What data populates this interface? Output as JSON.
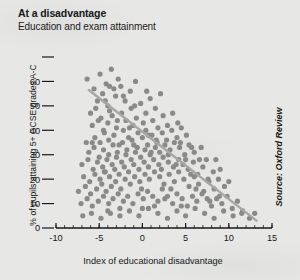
{
  "figure": {
    "title": "At a disadvantage",
    "subtitle": "Education and exam attainment",
    "source": "Source: Oxford Review",
    "background_color": "#e7e7e5",
    "text_color": "#16181a"
  },
  "chart_data": {
    "type": "scatter",
    "title": "At a disadvantage",
    "subtitle": "Education and exam attainment",
    "xlabel": "Index of educational disadvantage",
    "ylabel": "% of pupils attaining 5+ GCSE grades A-C",
    "source": "Source: Oxford Review",
    "xlim": [
      -10,
      15
    ],
    "ylim": [
      0,
      70
    ],
    "xticks": [
      -10,
      -5,
      0,
      5,
      10,
      15
    ],
    "xtick_labels": [
      "-10",
      "-5",
      "0",
      "5",
      "10",
      "15"
    ],
    "yticks": [
      0,
      10,
      20,
      30,
      40,
      50,
      60,
      70
    ],
    "ytick_labels": [
      "0",
      "10",
      "20",
      "30",
      "40",
      "50",
      "60",
      ""
    ],
    "xminor_step": 1,
    "grid": false,
    "legend": null,
    "marker_color": "#8a8a88",
    "marker_size": 2.6,
    "trendline": {
      "type": "linear",
      "color": "#a7a7a4",
      "width": 2.4,
      "x_start": -6.2,
      "y_start": 56.5,
      "x_end": 13.2,
      "y_end": 3.0,
      "slope": -2.76,
      "intercept": 39.4,
      "correlation": "negative"
    },
    "points": [
      [
        -6.4,
        61
      ],
      [
        -5.6,
        57
      ],
      [
        -4.9,
        63
      ],
      [
        -4.2,
        59
      ],
      [
        -3.6,
        65
      ],
      [
        -5.2,
        52
      ],
      [
        -4.6,
        55
      ],
      [
        -4.0,
        50
      ],
      [
        -3.3,
        57
      ],
      [
        -2.8,
        61
      ],
      [
        -6.0,
        47
      ],
      [
        -5.4,
        49
      ],
      [
        -4.8,
        45
      ],
      [
        -4.3,
        52
      ],
      [
        -3.8,
        48
      ],
      [
        -3.1,
        54
      ],
      [
        -2.5,
        58
      ],
      [
        -2.0,
        52
      ],
      [
        -1.4,
        56
      ],
      [
        -0.8,
        60
      ],
      [
        -5.8,
        42
      ],
      [
        -5.1,
        44
      ],
      [
        -4.5,
        40
      ],
      [
        -4.0,
        43
      ],
      [
        -3.5,
        46
      ],
      [
        -3.0,
        41
      ],
      [
        -2.4,
        47
      ],
      [
        -1.9,
        44
      ],
      [
        -1.3,
        49
      ],
      [
        -0.7,
        45
      ],
      [
        -0.2,
        51
      ],
      [
        0.4,
        47
      ],
      [
        0.9,
        53
      ],
      [
        1.5,
        49
      ],
      [
        2.1,
        55
      ],
      [
        -5.5,
        37
      ],
      [
        -4.9,
        35
      ],
      [
        -4.4,
        39
      ],
      [
        -3.9,
        36
      ],
      [
        -3.3,
        38
      ],
      [
        -2.7,
        34
      ],
      [
        -2.2,
        40
      ],
      [
        -1.6,
        37
      ],
      [
        -1.1,
        42
      ],
      [
        -0.5,
        39
      ],
      [
        0.1,
        43
      ],
      [
        0.7,
        38
      ],
      [
        1.2,
        44
      ],
      [
        1.8,
        41
      ],
      [
        2.4,
        46
      ],
      [
        2.9,
        42
      ],
      [
        3.5,
        47
      ],
      [
        4.1,
        43
      ],
      [
        -6.2,
        31
      ],
      [
        -5.6,
        33
      ],
      [
        -5.0,
        29
      ],
      [
        -4.5,
        32
      ],
      [
        -3.9,
        30
      ],
      [
        -3.4,
        34
      ],
      [
        -2.9,
        31
      ],
      [
        -2.3,
        35
      ],
      [
        -1.8,
        32
      ],
      [
        -1.2,
        36
      ],
      [
        -0.6,
        33
      ],
      [
        0.0,
        37
      ],
      [
        0.6,
        34
      ],
      [
        1.1,
        38
      ],
      [
        1.7,
        35
      ],
      [
        2.3,
        39
      ],
      [
        2.8,
        36
      ],
      [
        3.4,
        40
      ],
      [
        4.0,
        37
      ],
      [
        4.5,
        41
      ],
      [
        5.1,
        38
      ],
      [
        5.7,
        33
      ],
      [
        -7.0,
        26
      ],
      [
        -6.3,
        28
      ],
      [
        -5.7,
        24
      ],
      [
        -5.2,
        27
      ],
      [
        -4.6,
        25
      ],
      [
        -4.1,
        28
      ],
      [
        -3.5,
        26
      ],
      [
        -3.0,
        29
      ],
      [
        -2.4,
        27
      ],
      [
        -1.9,
        30
      ],
      [
        -1.3,
        28
      ],
      [
        -0.8,
        31
      ],
      [
        -0.2,
        29
      ],
      [
        0.3,
        32
      ],
      [
        0.9,
        30
      ],
      [
        1.5,
        33
      ],
      [
        2.0,
        31
      ],
      [
        2.6,
        34
      ],
      [
        3.2,
        32
      ],
      [
        3.7,
        35
      ],
      [
        4.3,
        33
      ],
      [
        4.9,
        30
      ],
      [
        5.4,
        34
      ],
      [
        6.0,
        31
      ],
      [
        6.6,
        28
      ],
      [
        -6.8,
        21
      ],
      [
        -6.1,
        19
      ],
      [
        -5.5,
        22
      ],
      [
        -4.9,
        20
      ],
      [
        -4.4,
        23
      ],
      [
        -3.8,
        21
      ],
      [
        -3.2,
        24
      ],
      [
        -2.7,
        22
      ],
      [
        -2.1,
        25
      ],
      [
        -1.6,
        23
      ],
      [
        -1.0,
        26
      ],
      [
        -0.4,
        24
      ],
      [
        0.2,
        27
      ],
      [
        0.7,
        25
      ],
      [
        1.3,
        28
      ],
      [
        1.9,
        26
      ],
      [
        2.4,
        29
      ],
      [
        3.0,
        27
      ],
      [
        3.6,
        25
      ],
      [
        4.2,
        28
      ],
      [
        4.7,
        26
      ],
      [
        5.3,
        24
      ],
      [
        5.9,
        27
      ],
      [
        6.4,
        22
      ],
      [
        7.0,
        25
      ],
      [
        7.6,
        20
      ],
      [
        8.2,
        23
      ],
      [
        -7.4,
        15
      ],
      [
        -6.6,
        17
      ],
      [
        -6.0,
        14
      ],
      [
        -5.3,
        16
      ],
      [
        -4.7,
        18
      ],
      [
        -4.2,
        15
      ],
      [
        -3.6,
        17
      ],
      [
        -3.1,
        19
      ],
      [
        -2.5,
        16
      ],
      [
        -2.0,
        20
      ],
      [
        -1.4,
        18
      ],
      [
        -0.9,
        21
      ],
      [
        -0.3,
        19
      ],
      [
        0.3,
        22
      ],
      [
        0.8,
        20
      ],
      [
        1.4,
        23
      ],
      [
        2.0,
        21
      ],
      [
        2.5,
        18
      ],
      [
        3.1,
        22
      ],
      [
        3.7,
        19
      ],
      [
        4.2,
        23
      ],
      [
        4.8,
        20
      ],
      [
        5.4,
        17
      ],
      [
        6.0,
        21
      ],
      [
        6.5,
        18
      ],
      [
        7.1,
        15
      ],
      [
        7.7,
        19
      ],
      [
        8.3,
        16
      ],
      [
        8.9,
        13
      ],
      [
        9.5,
        17
      ],
      [
        -7.1,
        10
      ],
      [
        -6.4,
        12
      ],
      [
        -5.8,
        9
      ],
      [
        -5.1,
        11
      ],
      [
        -4.5,
        13
      ],
      [
        -3.9,
        10
      ],
      [
        -3.4,
        12
      ],
      [
        -2.8,
        14
      ],
      [
        -2.2,
        11
      ],
      [
        -1.7,
        13
      ],
      [
        -1.1,
        10
      ],
      [
        -0.5,
        14
      ],
      [
        0.1,
        12
      ],
      [
        0.6,
        15
      ],
      [
        1.2,
        13
      ],
      [
        1.8,
        11
      ],
      [
        2.3,
        16
      ],
      [
        2.9,
        13
      ],
      [
        3.5,
        10
      ],
      [
        4.0,
        14
      ],
      [
        4.6,
        12
      ],
      [
        5.2,
        9
      ],
      [
        5.8,
        13
      ],
      [
        6.3,
        11
      ],
      [
        6.9,
        14
      ],
      [
        7.5,
        12
      ],
      [
        8.0,
        9
      ],
      [
        8.6,
        12
      ],
      [
        9.2,
        10
      ],
      [
        9.8,
        13
      ],
      [
        10.4,
        8
      ],
      [
        11.0,
        11
      ],
      [
        11.6,
        7
      ],
      [
        -6.9,
        5
      ],
      [
        -5.9,
        6
      ],
      [
        -4.8,
        4
      ],
      [
        -3.7,
        6
      ],
      [
        -2.6,
        5
      ],
      [
        -1.5,
        7
      ],
      [
        -0.4,
        5
      ],
      [
        0.7,
        8
      ],
      [
        1.8,
        6
      ],
      [
        2.9,
        4
      ],
      [
        4.0,
        7
      ],
      [
        5.0,
        5
      ],
      [
        6.1,
        8
      ],
      [
        7.2,
        6
      ],
      [
        8.3,
        4
      ],
      [
        9.4,
        7
      ],
      [
        10.5,
        5
      ],
      [
        11.5,
        6
      ],
      [
        12.4,
        4
      ],
      [
        13.0,
        6
      ],
      [
        -2.9,
        44
      ],
      [
        -1.5,
        41
      ],
      [
        0.4,
        40
      ],
      [
        1.6,
        36
      ],
      [
        3.0,
        30
      ],
      [
        4.4,
        35
      ],
      [
        2.2,
        24
      ],
      [
        5.6,
        22
      ],
      [
        6.8,
        33
      ],
      [
        8.8,
        20
      ],
      [
        -3.8,
        58
      ],
      [
        -2.2,
        54
      ],
      [
        -0.9,
        50
      ],
      [
        0.5,
        56
      ],
      [
        1.0,
        31
      ],
      [
        -4.3,
        23
      ],
      [
        -5.8,
        35
      ],
      [
        -1.0,
        34
      ],
      [
        2.6,
        12
      ],
      [
        3.9,
        26
      ],
      [
        7.4,
        28
      ],
      [
        9.0,
        24
      ],
      [
        10.0,
        19
      ],
      [
        5.0,
        28
      ],
      [
        6.2,
        16
      ],
      [
        -0.1,
        16
      ],
      [
        1.4,
        9
      ],
      [
        -2.6,
        8
      ],
      [
        -4.0,
        7
      ],
      [
        -6.5,
        35
      ],
      [
        0.0,
        8
      ],
      [
        3.3,
        16
      ],
      [
        4.5,
        9
      ],
      [
        7.8,
        11
      ],
      [
        8.5,
        28
      ]
    ]
  }
}
